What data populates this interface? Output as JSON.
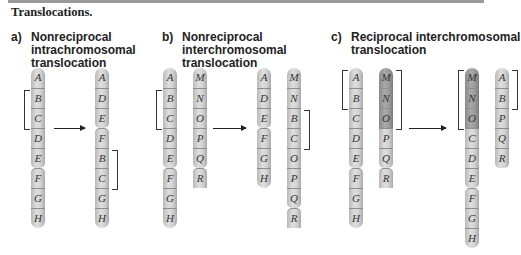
{
  "caption": "Translocations.",
  "panels": [
    {
      "letter": "a)",
      "title": "Nonreciprocal\nintrachromosomal\ntranslocation",
      "before": [
        {
          "segments": [
            "A",
            "B",
            "C",
            "D",
            "E",
            "F",
            "G",
            "H"
          ],
          "dark": []
        }
      ],
      "after": [
        {
          "segments": [
            "A",
            "D",
            "E",
            "F",
            "B",
            "C",
            "G",
            "H"
          ],
          "dark": []
        }
      ]
    },
    {
      "letter": "b)",
      "title": "Nonreciprocal\ninterchromosomal\ntranslocation",
      "before": [
        {
          "segments": [
            "A",
            "B",
            "C",
            "D",
            "E",
            "F",
            "G",
            "H"
          ],
          "dark": []
        },
        {
          "segments": [
            "M",
            "N",
            "O",
            "P",
            "Q",
            "R"
          ],
          "dark": []
        }
      ],
      "after": [
        {
          "segments": [
            "A",
            "D",
            "E",
            "F",
            "G",
            "H"
          ],
          "dark": []
        },
        {
          "segments": [
            "M",
            "N",
            "B",
            "C",
            "O",
            "P",
            "Q",
            "R"
          ],
          "dark": []
        }
      ]
    },
    {
      "letter": "c)",
      "title": "Reciprocal interchromosomal\ntranslocation",
      "before": [
        {
          "segments": [
            "A",
            "B",
            "C",
            "D",
            "E",
            "F",
            "G",
            "H"
          ],
          "dark": []
        },
        {
          "segments": [
            "M",
            "N",
            "O",
            "P",
            "Q",
            "R"
          ],
          "dark": [
            "M",
            "N",
            "O"
          ]
        }
      ],
      "after": [
        {
          "segments": [
            "M",
            "N",
            "O",
            "C",
            "D",
            "E",
            "F",
            "G",
            "H"
          ],
          "dark": [
            "M",
            "N",
            "O"
          ]
        },
        {
          "segments": [
            "A",
            "B",
            "P",
            "Q",
            "R"
          ],
          "dark": []
        }
      ]
    }
  ],
  "colors": {
    "segment_light": "#d2d2d2",
    "segment_dark": "#9c9c9c",
    "ink": "#222222"
  }
}
